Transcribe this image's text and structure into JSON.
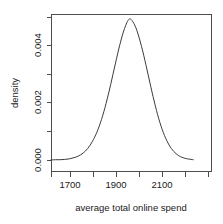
{
  "chart_data": {
    "type": "line",
    "title": "",
    "subtitle": "",
    "xlabel": "average total online spend",
    "ylabel": "density",
    "xlim": [
      1617,
      2236
    ],
    "ylim": [
      0,
      0.00508
    ],
    "grid": false,
    "legend": null,
    "annotations": [],
    "x_ticks": [
      1700,
      1900,
      2100
    ],
    "x_tick_labels": [
      "1700",
      "1900",
      "2100"
    ],
    "x_minor_ticks": [
      1617,
      1800,
      2000,
      2200,
      2236
    ],
    "y_ticks": [
      0.0,
      0.002,
      0.004
    ],
    "y_tick_labels": [
      "0.000",
      "0.002",
      "0.004"
    ],
    "y_minor_ticks": [
      0.001,
      0.003,
      0.005
    ],
    "distribution": {
      "shape": "normal-density",
      "mean": 1974,
      "sd": 83,
      "peak_x": 1974,
      "peak_y": 0.0048
    },
    "series": [
      {
        "name": "density",
        "x": [
          1617,
          1637,
          1657,
          1677,
          1697,
          1717,
          1737,
          1757,
          1777,
          1797,
          1817,
          1837,
          1857,
          1877,
          1897,
          1917,
          1937,
          1957,
          1974,
          1991,
          2011,
          2031,
          2051,
          2071,
          2091,
          2111,
          2131,
          2151,
          2171,
          2191,
          2211,
          2236
        ],
        "values": [
          0.0,
          1e-05,
          1e-05,
          2e-05,
          4e-05,
          8e-05,
          0.00014,
          0.00024,
          0.0004,
          0.00064,
          0.00097,
          0.00141,
          0.00197,
          0.00263,
          0.00334,
          0.00402,
          0.00457,
          0.0049,
          0.0048,
          0.0045,
          0.00395,
          0.00328,
          0.00256,
          0.00188,
          0.0013,
          0.00085,
          0.00052,
          0.0003,
          0.00016,
          8e-05,
          4e-05,
          1e-05
        ]
      }
    ]
  },
  "colors": {
    "curve": "#3c3c3c",
    "axis": "#4d4d4d",
    "text": "#1a1a1a",
    "background": "#ffffff"
  }
}
